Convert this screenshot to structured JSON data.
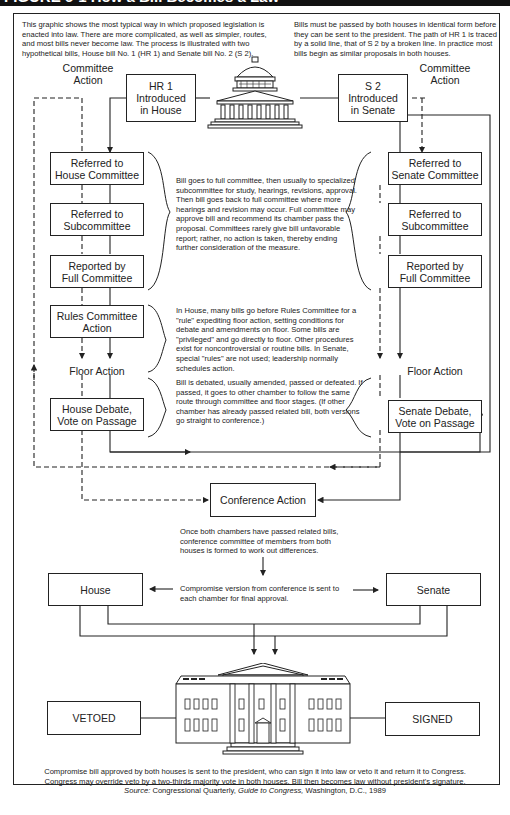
{
  "figure": {
    "title": "FIGURE 6-1  How a Bill Becomes a Law"
  },
  "intro": {
    "left": "This graphic shows the most typical way in which proposed legislation is enacted into law. There are more complicated, as well as simpler, routes, and most bills never become law. The process is illustrated with two hypothetical bills, House bill No. 1 (HR 1) and Senate bill No. 2 (S 2).",
    "right": "Bills must be passed by both houses in identical form before they can be sent to the president. The path of HR 1 is traced by a solid line, that of S 2 by a broken line. In practice most bills begin as similar proposals in both houses."
  },
  "house": {
    "committee_action_label": "Committee\nAction",
    "introduced": "HR 1\nIntroduced\nin House",
    "referred_committee": "Referred to\nHouse Committee",
    "referred_subcommittee": "Referred to\nSubcommittee",
    "reported": "Reported by\nFull Committee",
    "rules": "Rules Committee\nAction",
    "floor_action": "Floor Action",
    "debate": "House Debate,\nVote on Passage"
  },
  "senate": {
    "committee_action_label": "Committee\nAction",
    "introduced": "S 2\nIntroduced\nin Senate",
    "referred_committee": "Referred to\nSenate Committee",
    "referred_subcommittee": "Referred to\nSubcommittee",
    "reported": "Reported by\nFull Committee",
    "floor_action": "Floor Action",
    "debate": "Senate Debate,\nVote on Passage"
  },
  "notes": {
    "committee": "Bill goes to full committee, then usually to specialized subcommittee for study, hearings, revisions, approval. Then bill goes back to full committee where more hearings and revision may occur. Full committee may approve bill and recommend its chamber pass the proposal. Committees rarely give bill unfavorable report; rather, no action is taken, thereby ending further consideration of the measure.",
    "rules": "In House, many bills go before Rules Committee for a \"rule\" expediting floor action, setting conditions for debate and amendments on floor. Some bills are \"privileged\" and go directly to floor. Other procedures exist for noncontroversial or routine bills. In Senate, special \"rules\" are not used; leadership normally schedules action.",
    "floor": "Bill is debated, usually amended, passed or defeated. If passed, it goes to other chamber to follow the same route through committee and floor stages. (If other chamber has already passed related bill, both versions go straight to conference.)",
    "conference": "Once both chambers have passed related bills, conference committee of members from both houses is formed to work out differences.",
    "compromise": "Compromise version from conference is sent to each chamber for final approval."
  },
  "conference": {
    "label": "Conference Action"
  },
  "final": {
    "house": "House",
    "senate": "Senate",
    "vetoed": "VETOED",
    "signed": "SIGNED"
  },
  "footer": {
    "line1": "Compromise bill approved by both houses is sent to the president, who can sign it into law or veto it and return it to Congress.",
    "line2": "Congress may override veto by a two-thirds majority vote in both houses. Bill then becomes law without president's signature.",
    "source_label": "Source:",
    "source_org": "Congressional Quarterly,",
    "source_title": "Guide to Congress,",
    "source_rest": "Washington, D.C., 1989"
  },
  "icons": {
    "capitol": "capitol-building-icon",
    "white_house": "white-house-icon"
  }
}
